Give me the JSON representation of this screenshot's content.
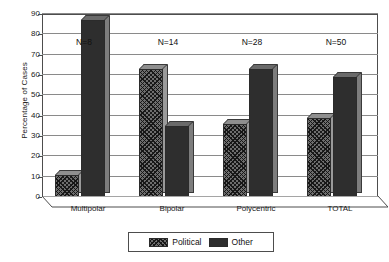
{
  "chart_data": {
    "type": "bar",
    "title": "",
    "xlabel": "",
    "ylabel": "Percentage of Cases",
    "ylim": [
      0,
      90
    ],
    "ytick_step": 10,
    "yticks": [
      0,
      10,
      20,
      30,
      40,
      50,
      60,
      70,
      80,
      90
    ],
    "grid": true,
    "legend_position": "bottom-center",
    "categories": [
      "Multipolar",
      "Bipolar",
      "Polycentric",
      "TOTAL"
    ],
    "series": [
      {
        "name": "Political",
        "values": [
          11,
          63,
          36,
          39
        ]
      },
      {
        "name": "Other",
        "values": [
          87,
          35,
          63,
          59
        ]
      }
    ],
    "annotations": [
      {
        "text": "N=8",
        "category": "Multipolar"
      },
      {
        "text": "N=14",
        "category": "Bipolar"
      },
      {
        "text": "N=28",
        "category": "Polycentric"
      },
      {
        "text": "N=50",
        "category": "TOTAL"
      }
    ],
    "colors": {
      "political": "#6e6e6e",
      "other": "#2e2e2e",
      "grid": "#8a8a8a",
      "axis": "#4d4d4d",
      "background": "#ffffff",
      "text": "#1a1a1a"
    }
  }
}
